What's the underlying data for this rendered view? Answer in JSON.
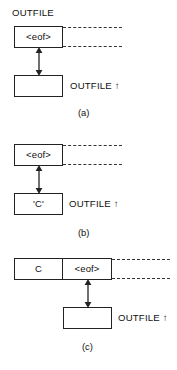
{
  "figure": {
    "panels": [
      {
        "id": "a",
        "caption": "(a)",
        "stream_label": "OUTFILE",
        "buffer_cells": [
          "<eof>"
        ],
        "pointer_box_text": "",
        "pointer_label": "OUTFILE ↑",
        "arrow": "double-vertical",
        "dashed_rails": 2
      },
      {
        "id": "b",
        "caption": "(b)",
        "stream_label": "",
        "buffer_cells": [
          "<eof>"
        ],
        "pointer_box_text": "'C'",
        "pointer_label": "OUTFILE ↑",
        "arrow": "double-vertical",
        "dashed_rails": 2
      },
      {
        "id": "c",
        "caption": "(c)",
        "stream_label": "",
        "buffer_cells": [
          "C",
          "<eof>"
        ],
        "pointer_box_text": "",
        "pointer_label": "OUTFILE ↑",
        "arrow": "double-vertical",
        "dashed_rails": 2
      }
    ]
  },
  "colors": {
    "stroke": "#222222",
    "dash": "#333333",
    "text": "#111111",
    "background": "#ffffff"
  }
}
